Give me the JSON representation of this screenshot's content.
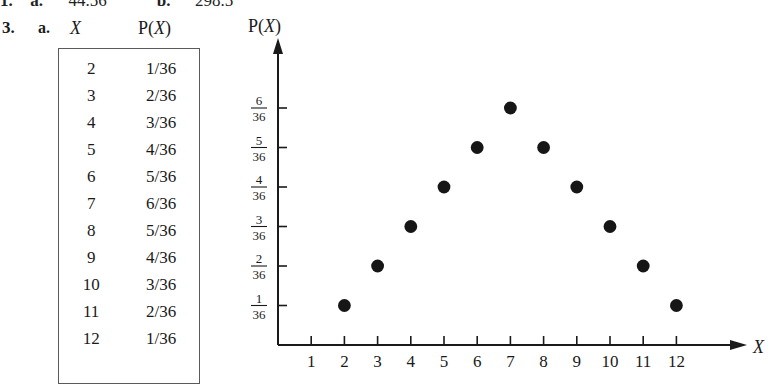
{
  "clipped_answer_line": {
    "number": "1.",
    "part_a_label": "a.",
    "part_a_value": "44.56",
    "part_b_label": "b.",
    "part_b_value": "298.5"
  },
  "problem": {
    "number": "3.",
    "part_label": "a.",
    "column_header_x": "X",
    "column_header_px_prefix": "P(",
    "column_header_px_var": "X",
    "column_header_px_suffix": ")"
  },
  "table": {
    "rows": [
      {
        "x": "2",
        "px": "1/36"
      },
      {
        "x": "3",
        "px": "2/36"
      },
      {
        "x": "4",
        "px": "3/36"
      },
      {
        "x": "5",
        "px": "4/36"
      },
      {
        "x": "6",
        "px": "5/36"
      },
      {
        "x": "7",
        "px": "6/36"
      },
      {
        "x": "8",
        "px": "5/36"
      },
      {
        "x": "9",
        "px": "4/36"
      },
      {
        "x": "10",
        "px": "3/36"
      },
      {
        "x": "11",
        "px": "2/36"
      },
      {
        "x": "12",
        "px": "1/36"
      }
    ]
  },
  "chart_data": {
    "type": "scatter",
    "title": "",
    "xlabel": "X",
    "ylabel": "P(X)",
    "x": [
      2,
      3,
      4,
      5,
      6,
      7,
      8,
      9,
      10,
      11,
      12
    ],
    "values": [
      0.027777777777777776,
      0.05555555555555555,
      0.08333333333333333,
      0.1111111111111111,
      0.1388888888888889,
      0.16666666666666666,
      0.1388888888888889,
      0.1111111111111111,
      0.08333333333333333,
      0.05555555555555555,
      0.027777777777777776
    ],
    "value_labels": [
      "1/36",
      "2/36",
      "3/36",
      "4/36",
      "5/36",
      "6/36",
      "5/36",
      "4/36",
      "3/36",
      "2/36",
      "1/36"
    ],
    "xtick_labels": [
      "1",
      "2",
      "3",
      "4",
      "5",
      "6",
      "7",
      "8",
      "9",
      "10",
      "11",
      "12"
    ],
    "xticks": [
      1,
      2,
      3,
      4,
      5,
      6,
      7,
      8,
      9,
      10,
      11,
      12
    ],
    "ytick_numerators": [
      "1",
      "2",
      "3",
      "4",
      "5",
      "6"
    ],
    "ytick_denominator": "36",
    "yticks": [
      1,
      2,
      3,
      4,
      5,
      6
    ],
    "ylim": [
      0,
      6.6
    ],
    "xlim": [
      0,
      13.4
    ],
    "grid": false,
    "legend": false,
    "marker_color": "#161616"
  }
}
